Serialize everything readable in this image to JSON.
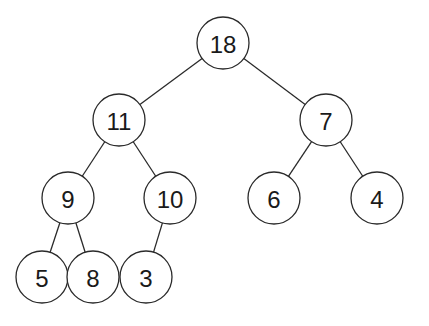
{
  "diagram": {
    "type": "binary-tree",
    "radius": 26,
    "stroke_color": "#2a2a2a",
    "text_color": "#1a1a1a",
    "nodes": [
      {
        "id": "n18",
        "label": "18",
        "x": 223,
        "y": 43
      },
      {
        "id": "n11",
        "label": "11",
        "x": 119,
        "y": 120
      },
      {
        "id": "n7",
        "label": "7",
        "x": 326,
        "y": 120
      },
      {
        "id": "n9",
        "label": "9",
        "x": 68,
        "y": 198
      },
      {
        "id": "n10",
        "label": "10",
        "x": 170,
        "y": 198
      },
      {
        "id": "n6",
        "label": "6",
        "x": 274,
        "y": 198
      },
      {
        "id": "n4",
        "label": "4",
        "x": 377,
        "y": 198
      },
      {
        "id": "n5",
        "label": "5",
        "x": 42,
        "y": 277
      },
      {
        "id": "n8",
        "label": "8",
        "x": 93,
        "y": 277
      },
      {
        "id": "n3",
        "label": "3",
        "x": 146,
        "y": 277
      }
    ],
    "edges": [
      {
        "from": "n18",
        "to": "n11"
      },
      {
        "from": "n18",
        "to": "n7"
      },
      {
        "from": "n11",
        "to": "n9"
      },
      {
        "from": "n11",
        "to": "n10"
      },
      {
        "from": "n7",
        "to": "n6"
      },
      {
        "from": "n7",
        "to": "n4"
      },
      {
        "from": "n9",
        "to": "n5"
      },
      {
        "from": "n9",
        "to": "n8"
      },
      {
        "from": "n10",
        "to": "n3"
      }
    ]
  }
}
